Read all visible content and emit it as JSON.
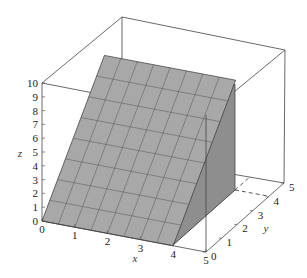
{
  "chart_data": {
    "type": "surface3d",
    "title": "",
    "xlabel": "x",
    "ylabel": "y",
    "zlabel": "z",
    "xlim": [
      0,
      5
    ],
    "ylim": [
      0,
      5
    ],
    "zlim": [
      0,
      10
    ],
    "x_ticks": [
      "0",
      "1",
      "2",
      "3",
      "4",
      "5"
    ],
    "y_ticks": [
      "0",
      "1",
      "2",
      "3",
      "4",
      "5"
    ],
    "z_ticks": [
      "0",
      "1",
      "2",
      "3",
      "4",
      "5",
      "6",
      "7",
      "8",
      "9",
      "10"
    ],
    "surface": {
      "description": "planar surface z = 2y over 0<=x<=4, 0<=y<=4, with a vertical wall at x=4",
      "x_domain": [
        0,
        4
      ],
      "y_domain": [
        0,
        4
      ],
      "z_range": [
        0,
        8
      ],
      "grid_divisions": 8
    },
    "domain_projection": "dashed lines at y=4 and x=4 on the floor"
  },
  "colors": {
    "surface": "#a8a8a8",
    "wall": "#8e8e8e",
    "floor": "#e2e2e2",
    "box": "#333333"
  }
}
